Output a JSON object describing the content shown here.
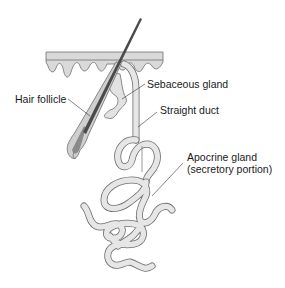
{
  "diagram": {
    "labels": {
      "sebaceous_gland": "Sebaceous gland",
      "hair_follicle": "Hair follicle",
      "straight_duct": "Straight duct",
      "apocrine_line1": "Apocrine gland",
      "apocrine_line2": "(secretory portion)"
    },
    "colors": {
      "skin_fill": "#d9d9d9",
      "outline": "#6e6e6e",
      "tube_fill": "#e6e6e6",
      "hair": "#4a4a4a",
      "follicle_inner": "#8a8a8a",
      "label_text": "#1a1a1a",
      "leader_line": "#333333"
    }
  }
}
